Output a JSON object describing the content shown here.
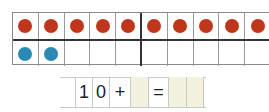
{
  "ten_frame": {
    "top_row": [
      {
        "filled": true,
        "color": "#c0361a"
      },
      {
        "filled": true,
        "color": "#c0361a"
      },
      {
        "filled": true,
        "color": "#c0361a"
      },
      {
        "filled": true,
        "color": "#c0361a"
      },
      {
        "filled": true,
        "color": "#c0361a"
      },
      {
        "filled": true,
        "color": "#c0361a"
      },
      {
        "filled": true,
        "color": "#c0361a"
      },
      {
        "filled": true,
        "color": "#c0361a"
      },
      {
        "filled": true,
        "color": "#c0361a"
      },
      {
        "filled": true,
        "color": "#c0361a"
      }
    ],
    "bottom_row": [
      {
        "filled": true,
        "color": "#2a8ab5"
      },
      {
        "filled": true,
        "color": "#2a8ab5"
      },
      {
        "filled": false
      },
      {
        "filled": false
      },
      {
        "filled": false
      },
      {
        "filled": false
      },
      {
        "filled": false
      },
      {
        "filled": false
      },
      {
        "filled": false
      },
      {
        "filled": false
      }
    ],
    "red_count": 10,
    "blue_count": 2
  },
  "equation": {
    "cells": [
      {
        "text": "1",
        "type": "digit"
      },
      {
        "text": "0",
        "type": "digit"
      },
      {
        "text": "+",
        "type": "operator"
      },
      {
        "text": "",
        "type": "answer-box"
      },
      {
        "text": "=",
        "type": "operator"
      },
      {
        "text": "",
        "type": "answer-box"
      },
      {
        "text": "",
        "type": "answer-box"
      }
    ],
    "answer_fill": "#f2f2df"
  }
}
